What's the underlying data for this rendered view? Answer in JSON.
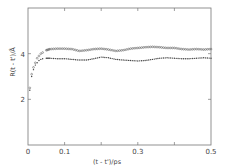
{
  "chart_data": {
    "type": "scatter",
    "title": "",
    "xlabel": "(t - t')/ps",
    "ylabel": "R(t - t')/Å",
    "xlim": [
      0,
      0.5
    ],
    "ylim": [
      0,
      6
    ],
    "x_ticks": [
      "0",
      "0.1",
      "0.3",
      "0.5"
    ],
    "y_ticks": [
      "2",
      "4"
    ],
    "grid": false,
    "legend": null,
    "series": [
      {
        "name": "upper (open circles)",
        "marker": "open-circle",
        "x": [
          0.005,
          0.01,
          0.015,
          0.02,
          0.025,
          0.03,
          0.035,
          0.04,
          0.05,
          0.06,
          0.08,
          0.1,
          0.12,
          0.14,
          0.16,
          0.18,
          0.2,
          0.22,
          0.24,
          0.26,
          0.28,
          0.3,
          0.32,
          0.34,
          0.36,
          0.38,
          0.4,
          0.42,
          0.44,
          0.46,
          0.48,
          0.5
        ],
        "values": [
          2.5,
          3.1,
          3.4,
          3.6,
          3.8,
          3.9,
          4.0,
          4.05,
          4.15,
          4.2,
          4.22,
          4.22,
          4.2,
          4.12,
          4.15,
          4.2,
          4.22,
          4.18,
          4.12,
          4.15,
          4.22,
          4.25,
          4.28,
          4.3,
          4.28,
          4.25,
          4.25,
          4.2,
          4.18,
          4.2,
          4.18,
          4.2
        ]
      },
      {
        "name": "lower (filled dots)",
        "marker": "filled-dot",
        "x": [
          0.005,
          0.01,
          0.015,
          0.02,
          0.025,
          0.03,
          0.035,
          0.04,
          0.05,
          0.06,
          0.08,
          0.1,
          0.12,
          0.14,
          0.16,
          0.18,
          0.2,
          0.22,
          0.24,
          0.26,
          0.28,
          0.3,
          0.32,
          0.34,
          0.36,
          0.38,
          0.4,
          0.42,
          0.44,
          0.46,
          0.48,
          0.5
        ],
        "values": [
          2.4,
          3.0,
          3.3,
          3.5,
          3.6,
          3.7,
          3.75,
          3.78,
          3.8,
          3.8,
          3.78,
          3.78,
          3.75,
          3.72,
          3.72,
          3.78,
          3.85,
          3.82,
          3.75,
          3.72,
          3.7,
          3.68,
          3.7,
          3.75,
          3.8,
          3.82,
          3.8,
          3.78,
          3.78,
          3.8,
          3.82,
          3.8
        ]
      }
    ]
  },
  "axes": {
    "x_label": "(t - t')/ps",
    "y_label": "R(t - t')/Å",
    "x_tick_labels": [
      "0",
      "0.1",
      "0.3",
      "0.5"
    ],
    "y_tick_labels": [
      "2",
      "4"
    ]
  }
}
